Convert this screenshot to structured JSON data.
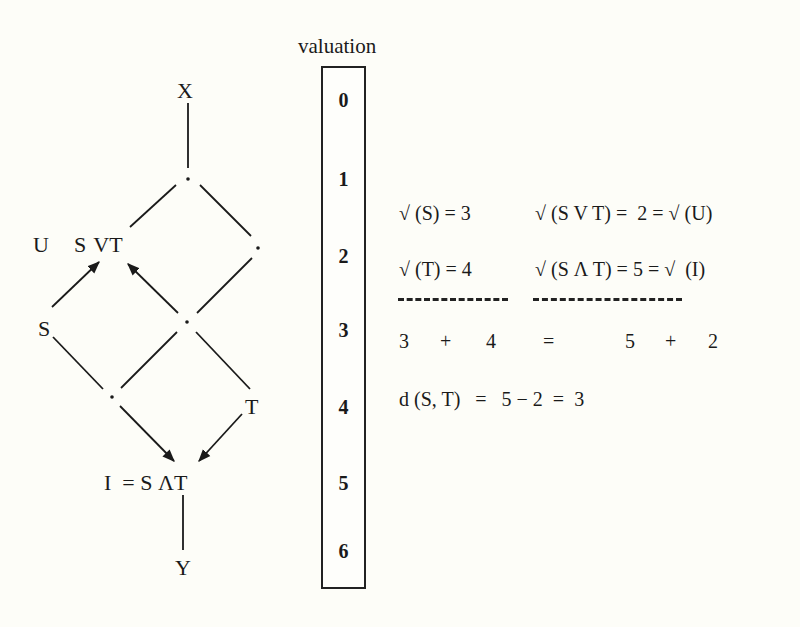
{
  "lattice": {
    "nodes": {
      "top": "X",
      "join_label_u": "U",
      "join_label": "S VT",
      "left": "S",
      "right": "T",
      "meet_label": "I  = S ΛT",
      "bottom": "Y"
    },
    "dot": "·"
  },
  "valuation": {
    "title": "valuation",
    "levels": [
      "0",
      "1",
      "2",
      "3",
      "4",
      "5",
      "6"
    ]
  },
  "equations": {
    "row1_left": "√ (S) = 3",
    "row1_right": "√ (S V T) =  2 = √ (U)",
    "row2_left": "√ (T) = 4",
    "row2_right": "√ (S Λ T) = 5 = √  (I)",
    "sum": [
      "3",
      "+",
      "4",
      "=",
      "5",
      "+",
      "2"
    ],
    "distance": "d (S, T)   =   5 − 2  =  3"
  },
  "colors": {
    "ink": "#1a1a1a",
    "paper": "#fdfdf8"
  }
}
